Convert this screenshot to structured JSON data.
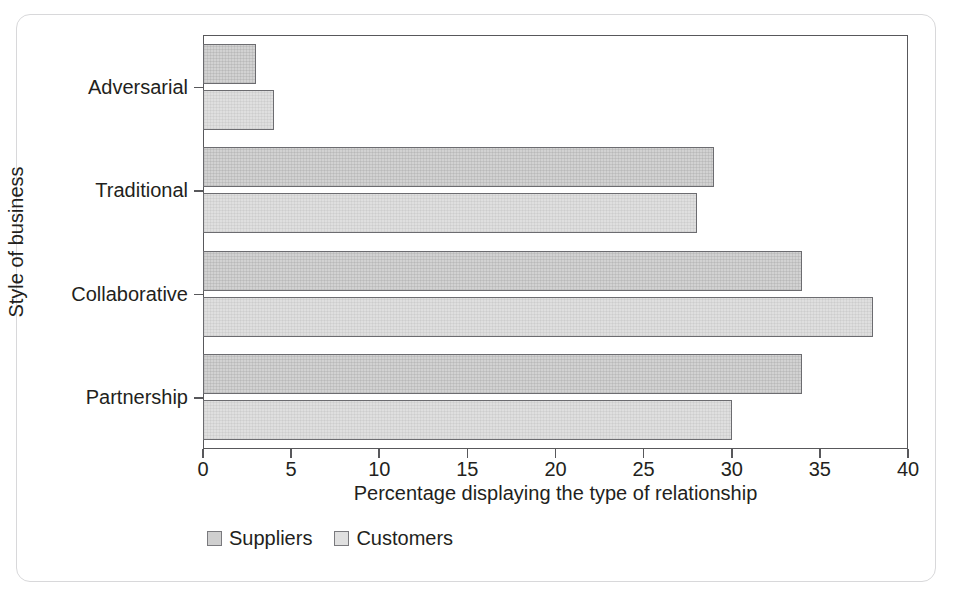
{
  "figure": {
    "frame_color": "#d8d8da",
    "axis_color": "#58585b"
  },
  "chart_data": {
    "type": "bar",
    "orientation": "horizontal",
    "title": "",
    "xlabel": "Percentage displaying the type of relationship",
    "ylabel": "Style of business",
    "categories": [
      "Adversarial",
      "Traditional",
      "Collaborative",
      "Partnership"
    ],
    "series": [
      {
        "name": "Suppliers",
        "color": "#d2d2d2",
        "values": [
          3,
          29,
          34,
          34
        ]
      },
      {
        "name": "Customers",
        "color": "#dfdfdf",
        "values": [
          4,
          28,
          38,
          30
        ]
      }
    ],
    "xlim": [
      0,
      40
    ],
    "ylim": [
      0,
      4
    ],
    "xticks": [
      0,
      5,
      10,
      15,
      20,
      25,
      30,
      35,
      40
    ],
    "xtick_labels": [
      "0",
      "5",
      "10",
      "15",
      "20",
      "25",
      "30",
      "35",
      "40"
    ],
    "grid": false,
    "legend_position": "bottom-left",
    "legend_entries": [
      "Suppliers",
      "Customers"
    ]
  }
}
